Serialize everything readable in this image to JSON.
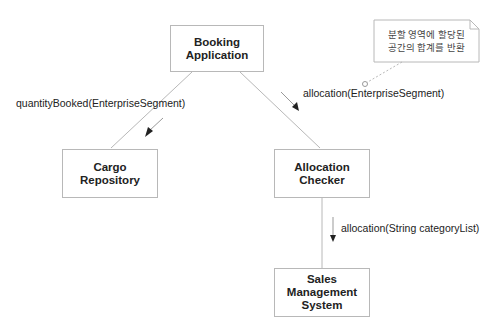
{
  "diagram": {
    "type": "uml-collaboration",
    "objects": [
      {
        "id": "booking",
        "label_line1": "Booking",
        "label_line2": "Application"
      },
      {
        "id": "cargo",
        "label_line1": "Cargo",
        "label_line2": "Repository"
      },
      {
        "id": "allocation",
        "label_line1": "Allocation",
        "label_line2": "Checker"
      },
      {
        "id": "sales",
        "label_line1": "Sales",
        "label_line2": "Management",
        "label_line3": "System"
      }
    ],
    "messages": [
      {
        "from": "booking",
        "to": "cargo",
        "label": "quantityBooked(EnterpriseSegment)"
      },
      {
        "from": "booking",
        "to": "allocation",
        "label": "allocation(EnterpriseSegment)"
      },
      {
        "from": "allocation",
        "to": "sales",
        "label": "allocation(String categoryList)"
      }
    ],
    "note": {
      "line1": "분할 영역에 할당된",
      "line2": "공간의 합계를 반환"
    },
    "colors": {
      "line": "#b8b8b8",
      "arrow": "#222222",
      "text": "#222222"
    }
  }
}
